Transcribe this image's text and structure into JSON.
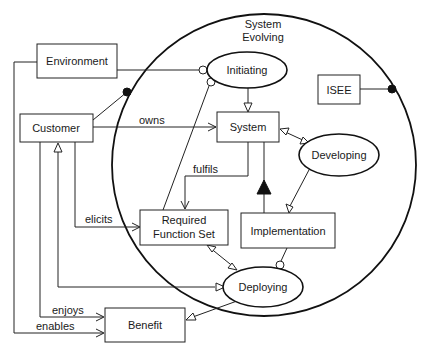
{
  "diagram": {
    "boundary": {
      "label_line1": "System",
      "label_line2": "Evolving"
    },
    "boxes": {
      "environment": "Environment",
      "customer": "Customer",
      "isee": "ISEE",
      "system": "System",
      "rfs_line1": "Required",
      "rfs_line2": "Function Set",
      "implementation": "Implementation",
      "benefit": "Benefit"
    },
    "processes": {
      "initiating": "Initiating",
      "developing": "Developing",
      "deploying": "Deploying"
    },
    "relations": {
      "owns": "owns",
      "fulfils": "fulfils",
      "elicits": "elicits",
      "enjoys": "enjoys",
      "enables": "enables"
    }
  }
}
